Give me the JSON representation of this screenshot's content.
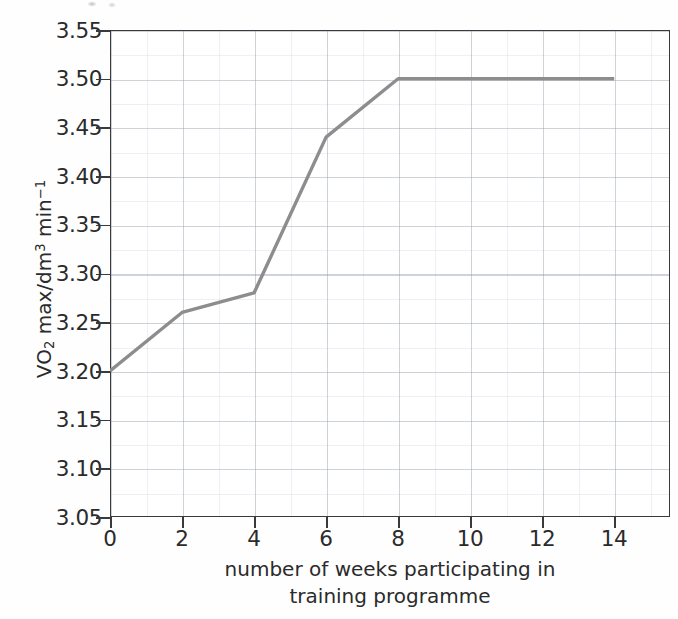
{
  "chart_data": {
    "type": "line",
    "title": "",
    "subtitle": "",
    "xlabel_lines": [
      "number of weeks participating in",
      "training programme"
    ],
    "xlabel": "number of weeks participating in training programme",
    "ylabel": "VO2 max/dm3 min-1",
    "ylabel_parts": {
      "prefix": "VO",
      "sub": "2",
      "mid": " max/dm",
      "sup1": "3",
      "unit": " min",
      "sup2": "−1"
    },
    "x": [
      0,
      2,
      4,
      6,
      8,
      14
    ],
    "values": [
      3.2,
      3.26,
      3.28,
      3.44,
      3.5,
      3.5
    ],
    "series": [
      {
        "name": "VO2 max",
        "points": [
          {
            "x": 0,
            "y": 3.2
          },
          {
            "x": 2,
            "y": 3.26
          },
          {
            "x": 4,
            "y": 3.28
          },
          {
            "x": 6,
            "y": 3.44
          },
          {
            "x": 8,
            "y": 3.5
          },
          {
            "x": 14,
            "y": 3.5
          }
        ],
        "color": "#8d8d8d"
      }
    ],
    "xlim": [
      0,
      15.55
    ],
    "ylim": [
      3.05,
      3.55
    ],
    "xticks": [
      0,
      2,
      4,
      6,
      8,
      10,
      12,
      14
    ],
    "xtick_labels": [
      "0",
      "2",
      "4",
      "6",
      "8",
      "10",
      "12",
      "14"
    ],
    "yticks": [
      3.05,
      3.1,
      3.15,
      3.2,
      3.25,
      3.3,
      3.35,
      3.4,
      3.45,
      3.5,
      3.55
    ],
    "ytick_labels": [
      "3.05",
      "3.10",
      "3.15",
      "3.20",
      "3.25",
      "3.30",
      "3.35",
      "3.40",
      "3.45",
      "3.50",
      "3.55"
    ],
    "grid": true,
    "grid_minor": true,
    "legend": false,
    "legend_position": "none",
    "markers": false,
    "line_color": "#8d8d8d",
    "axis_color": "#3a3a3a",
    "background_color": "#ffffff"
  }
}
